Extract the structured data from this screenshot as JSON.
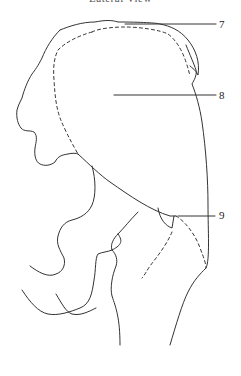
{
  "caption": {
    "text": "Lateral View",
    "truncated": true
  },
  "diagram": {
    "type": "anatomical line drawing",
    "stroke_color": "#333333",
    "background": "#ffffff",
    "callouts": [
      {
        "label": "7",
        "line_from": [
          125,
          24
        ],
        "line_to": [
          216,
          24
        ],
        "label_pos": [
          219,
          19
        ]
      },
      {
        "label": "8",
        "line_from": [
          114,
          95
        ],
        "line_to": [
          216,
          95
        ],
        "label_pos": [
          219,
          90
        ]
      },
      {
        "label": "9",
        "line_from": [
          178,
          216
        ],
        "line_to": [
          215,
          216
        ],
        "label_pos": [
          219,
          210
        ]
      }
    ]
  }
}
